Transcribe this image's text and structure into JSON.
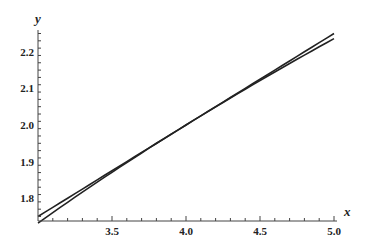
{
  "chart_data": {
    "type": "line",
    "title": "",
    "xlabel": "x",
    "ylabel": "y",
    "xlim": [
      3.0,
      5.0
    ],
    "ylim": [
      1.737,
      2.27
    ],
    "x_ticks": [
      "3.5",
      "4.0",
      "4.5",
      "5.0"
    ],
    "y_ticks": [
      "1.8",
      "1.9",
      "2.0",
      "2.1",
      "2.2"
    ],
    "grid": false,
    "legend": null,
    "series": [
      {
        "name": "curve",
        "function": "sqrt(x)",
        "x": [
          3.0,
          3.5,
          4.0,
          4.5,
          5.0
        ],
        "values": [
          1.732,
          1.871,
          2.0,
          2.121,
          2.236
        ]
      },
      {
        "name": "tangent line",
        "function": "2 + (x-4)/4",
        "x": [
          3.0,
          3.5,
          4.0,
          4.5,
          5.0
        ],
        "values": [
          1.75,
          1.875,
          2.0,
          2.125,
          2.25
        ]
      }
    ],
    "line_color": "#222222"
  }
}
